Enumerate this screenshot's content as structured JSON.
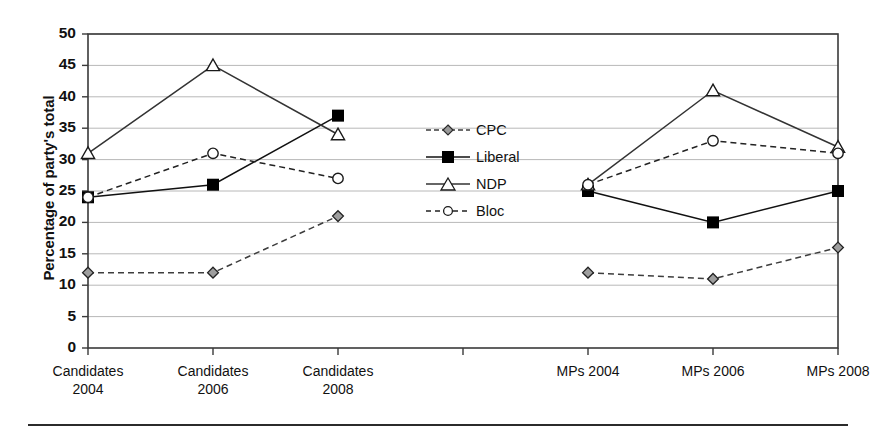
{
  "chart_data": {
    "type": "line",
    "title": "",
    "subtitle": "",
    "xlabel": "",
    "ylabel": "Percentage of party's total",
    "categories": [
      "Candidates\n2004",
      "Candidates\n2006",
      "Candidates\n2008",
      "",
      "MPs 2004",
      "MPs 2006",
      "MPs 2008"
    ],
    "category_labels_plain": [
      "Candidates 2004",
      "Candidates 2006",
      "Candidates 2008",
      "",
      "MPs 2004",
      "MPs 2006",
      "MPs 2008"
    ],
    "series": [
      {
        "name": "CPC",
        "values": [
          12,
          12,
          21,
          null,
          12,
          11,
          16
        ],
        "marker": "diamond",
        "line": "dashed",
        "color": "#3d3d3d"
      },
      {
        "name": "Liberal",
        "values": [
          24,
          26,
          37,
          null,
          25,
          20,
          25
        ],
        "marker": "filled-square",
        "line": "solid",
        "color": "#111111"
      },
      {
        "name": "NDP",
        "values": [
          31,
          45,
          34,
          null,
          26,
          41,
          32
        ],
        "marker": "open-triangle",
        "line": "solid",
        "color": "#333333"
      },
      {
        "name": "Bloc",
        "values": [
          24,
          31,
          27,
          null,
          26,
          33,
          31
        ],
        "marker": "open-circle",
        "line": "dashed",
        "color": "#222222"
      }
    ],
    "ylim": [
      0,
      50
    ],
    "ytick_values": [
      0,
      5,
      10,
      15,
      20,
      25,
      30,
      35,
      40,
      45,
      50
    ],
    "ytick_labels": [
      "0",
      "5",
      "10",
      "15",
      "20",
      "25",
      "30",
      "35",
      "40",
      "45",
      "50"
    ],
    "grid": true,
    "grid_axis": "y",
    "legend_position": "center",
    "frame": true,
    "gridline_color": "#b8b8b8",
    "axis_color": "#3a3a3a"
  },
  "legend": {
    "entries": [
      {
        "label": "CPC"
      },
      {
        "label": "Liberal"
      },
      {
        "label": "NDP"
      },
      {
        "label": "Bloc"
      }
    ]
  }
}
